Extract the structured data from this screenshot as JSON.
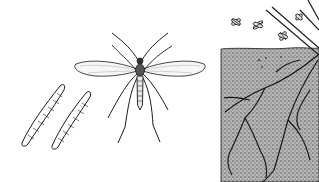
{
  "illustration": {
    "subject": "fungus gnat life stages",
    "panels": [
      {
        "id": "larvae",
        "description": "two segmented larvae"
      },
      {
        "id": "adult",
        "description": "adult winged gnat, dorsal view"
      },
      {
        "id": "soil",
        "description": "soil cross-section with roots and small flying gnats above"
      }
    ],
    "colors": {
      "ink": "#1a1a1a",
      "soil": "#9a9a9a",
      "background": "#ffffff"
    }
  }
}
